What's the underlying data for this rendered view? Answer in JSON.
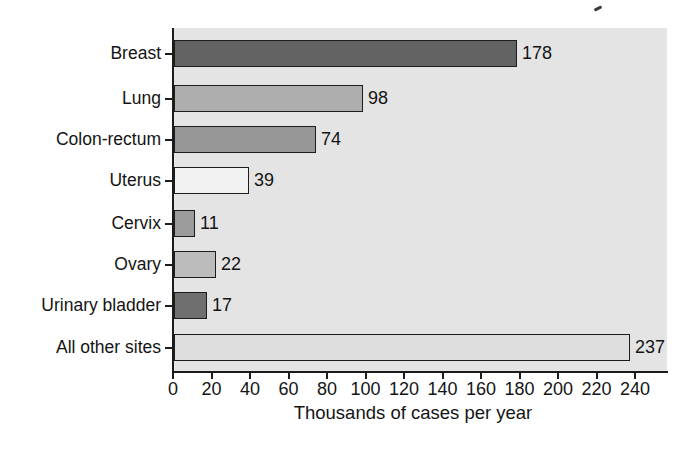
{
  "figure": {
    "background": "#ffffff",
    "plot_background": "#e4e4e4",
    "axis_color": "#1c1c1c",
    "bar_border_color": "#1c1c1c"
  },
  "chart_data": {
    "type": "bar",
    "orientation": "horizontal",
    "title": "",
    "xlabel": "Thousands of cases per year",
    "ylabel": "",
    "xlim": [
      0,
      256
    ],
    "grid": false,
    "legend": false,
    "x_ticks": [
      0,
      20,
      40,
      60,
      80,
      100,
      120,
      140,
      160,
      180,
      200,
      220,
      240
    ],
    "categories": [
      "Breast",
      "Lung",
      "Colon-rectum",
      "Uterus",
      "Cervix",
      "Ovary",
      "Urinary bladder",
      "All other sites"
    ],
    "values": [
      178,
      98,
      74,
      39,
      11,
      22,
      17,
      237
    ],
    "bars": [
      {
        "label": "Breast",
        "value": 178,
        "color": "#636363"
      },
      {
        "label": "Lung",
        "value": 98,
        "color": "#aeaeae"
      },
      {
        "label": "Colon-rectum",
        "value": 74,
        "color": "#979797"
      },
      {
        "label": "Uterus",
        "value": 39,
        "color": "#f2f2f2"
      },
      {
        "label": "Cervix",
        "value": 11,
        "color": "#9b9b9b"
      },
      {
        "label": "Ovary",
        "value": 22,
        "color": "#bcbcbc"
      },
      {
        "label": "Urinary bladder",
        "value": 17,
        "color": "#6f6f6f"
      },
      {
        "label": "All other sites",
        "value": 237,
        "color": "#dedede"
      }
    ]
  }
}
